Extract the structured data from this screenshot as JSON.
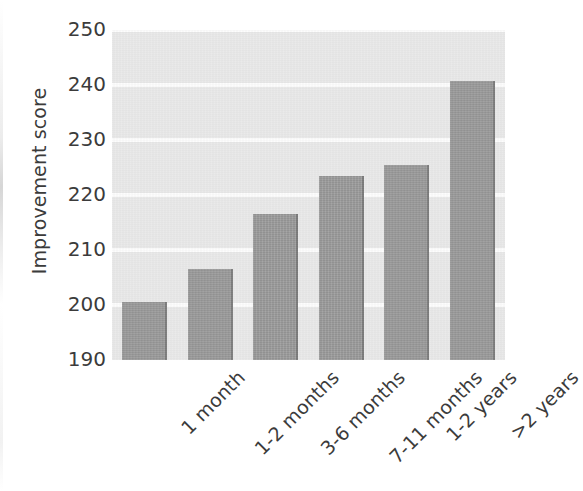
{
  "chart_data": {
    "type": "bar",
    "title": "",
    "xlabel": "",
    "ylabel": "Improvement score",
    "categories": [
      "1 month",
      "1-2 months",
      "3-6 months",
      "7-11 months",
      "1-2 years",
      ">2 years"
    ],
    "values": [
      200.5,
      206.5,
      216.5,
      223.5,
      225.5,
      240.8
    ],
    "ylim": [
      190,
      250
    ],
    "yticks": [
      190,
      200,
      210,
      220,
      230,
      240,
      250
    ],
    "grid": true,
    "grid_orientation": "horizontal",
    "legend": null,
    "bar_color": "#9b9b9b",
    "bar_edge_color": "#7c7c7c",
    "panel_background": "#e9e9e9",
    "gridline_color": "#fdfdfd",
    "text_color": "#3b3b3b",
    "xtick_rotation": -45
  }
}
